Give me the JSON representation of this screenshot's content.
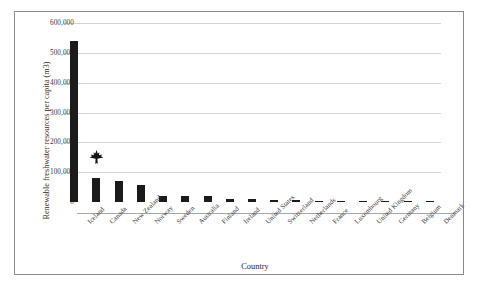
{
  "chart_data": {
    "type": "bar",
    "title": "",
    "xlabel": "Country",
    "ylabel": "Renewable freshwater resources per capita (m3)",
    "ylim": [
      0,
      600000
    ],
    "yticks": [
      "0",
      "100,000",
      "200,000",
      "300,000",
      "400,000",
      "500,000",
      "600,000"
    ],
    "ytick_values": [
      0,
      100000,
      200000,
      300000,
      400000,
      500000,
      600000
    ],
    "grid": true,
    "legend": "none",
    "bar_color": "#1b1b1b",
    "categories": [
      "Iceland",
      "Canada",
      "New Zealand",
      "Norway",
      "Sweden",
      "Australia",
      "Finland",
      "Ireland",
      "United States",
      "Switzerland",
      "Netherlands",
      "France",
      "Luxembourg",
      "United Kingdom",
      "Germany",
      "Belgium",
      "Denmark"
    ],
    "values": [
      540000,
      81000,
      72000,
      58000,
      20000,
      19000,
      19000,
      11000,
      9500,
      6000,
      5500,
      3300,
      3000,
      2400,
      1900,
      1700,
      1100
    ],
    "annotations": [
      {
        "name": "maple-leaf-marker",
        "symbol": "maple-leaf",
        "category": "Canada",
        "glyph": "\u0001"
      }
    ]
  }
}
